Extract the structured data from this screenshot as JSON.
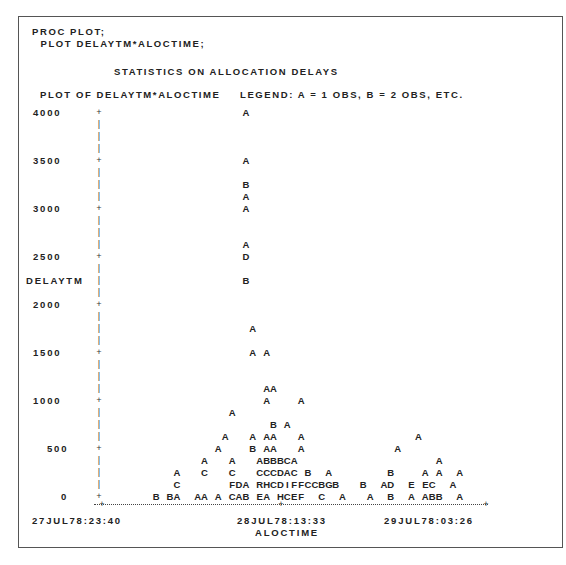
{
  "code": {
    "line1": "PROC PLOT;",
    "line2": "  PLOT DELAYTM*ALOCTIME;"
  },
  "title": "STATISTICS ON ALLOCATION DELAYS",
  "plot_header": "PLOT OF DELAYTM*ALOCTIME",
  "legend": "LEGEND: A = 1 OBS, B = 2 OBS, ETC.",
  "y_axis": {
    "label": "DELAYTM",
    "ticks": [
      "4000",
      "3500",
      "3000",
      "2500",
      "2000",
      "1500",
      "1000",
      "500",
      "0"
    ]
  },
  "x_axis": {
    "label": "ALOCTIME",
    "ticks": [
      "27JUL78:23:40",
      "28JUL78:13:33",
      "29JUL78:03:26"
    ]
  },
  "chart_data": {
    "type": "scatter",
    "title": "STATISTICS ON ALLOCATION DELAYS",
    "subtitle": "PLOT OF DELAYTM*ALOCTIME",
    "legend": "A = 1 OBS, B = 2 OBS, ETC.",
    "xlabel": "ALOCTIME",
    "ylabel": "DELAYTM",
    "x_ticks": [
      "27JUL78:23:40",
      "28JUL78:13:33",
      "29JUL78:03:26"
    ],
    "y_ticks": [
      4000,
      3500,
      3000,
      2500,
      2000,
      1500,
      1000,
      500,
      0
    ],
    "ylim": [
      0,
      4000
    ],
    "grid": false,
    "note": "Character plot; each row = 125 units of DELAYTM, each column ≈ one time bin. Symbols encode observation counts (A=1, B=2, ...).",
    "rows": [
      {
        "row": 0,
        "y": 4000,
        "text": "                     A"
      },
      {
        "row": 4,
        "y": 3500,
        "text": "                     A"
      },
      {
        "row": 6,
        "y": 3250,
        "text": "                     B"
      },
      {
        "row": 7,
        "y": 3125,
        "text": "                     A"
      },
      {
        "row": 8,
        "y": 3000,
        "text": "                     A"
      },
      {
        "row": 11,
        "y": 2625,
        "text": "                     A"
      },
      {
        "row": 12,
        "y": 2500,
        "text": "                     D"
      },
      {
        "row": 14,
        "y": 2250,
        "text": "                     B"
      },
      {
        "row": 18,
        "y": 1750,
        "text": "                      A"
      },
      {
        "row": 20,
        "y": 1500,
        "text": "                      A A"
      },
      {
        "row": 23,
        "y": 1125,
        "text": "                        AA"
      },
      {
        "row": 24,
        "y": 1000,
        "text": "                        A    A"
      },
      {
        "row": 25,
        "y": 875,
        "text": "                   A"
      },
      {
        "row": 26,
        "y": 750,
        "text": "                         B A"
      },
      {
        "row": 27,
        "y": 625,
        "text": "                  A   A AA   A                A"
      },
      {
        "row": 28,
        "y": 500,
        "text": "                 A    B AA   A             A"
      },
      {
        "row": 29,
        "y": 375,
        "text": "               A   A   ABBBCA                    A"
      },
      {
        "row": 30,
        "y": 250,
        "text": "           A   C   C   CCCDAC B  A        B    A A  A"
      },
      {
        "row": 31,
        "y": 125,
        "text": "           C       FDA RHCDIFFCCBGB   B  AD  E EC  A"
      },
      {
        "row": 32,
        "y": 0,
        "text": "        B BA  AA A CAB EA HCEF  C  A   A  B  A ABB  A"
      }
    ]
  }
}
